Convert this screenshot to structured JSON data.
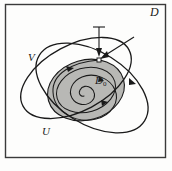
{
  "figure": {
    "type": "mathematical-diagram",
    "background_color": "#fdfdfc",
    "stroke_color": "#1a1a1a",
    "shade_color": "#b8b8b5",
    "frame": {
      "name": "outer-region-frame",
      "x": 5,
      "y": 4,
      "width": 161,
      "height": 154,
      "stroke": "#333333"
    },
    "labels": {
      "outer_region": "D",
      "ellipse_v": "V",
      "ellipse_u": "U",
      "inner_region_base": "D",
      "inner_region_sub": "0"
    },
    "marked_point": {
      "name": "convergence-point",
      "x": 99,
      "y": 60
    },
    "arrows": [
      {
        "name": "vertical-arrow",
        "from_x": 99,
        "from_y": 27,
        "to_x": 99,
        "to_y": 57
      },
      {
        "name": "diagonal-arrow",
        "from_x": 131,
        "from_y": 38,
        "to_x": 103,
        "to_y": 57
      }
    ],
    "spiral": {
      "name": "inward-spiral-trajectory",
      "turns": 2.6,
      "center_x": 82,
      "center_y": 90,
      "arrowheads": [
        {
          "x": 72,
          "y": 68
        },
        {
          "x": 101,
          "y": 79
        },
        {
          "x": 104,
          "y": 103
        }
      ]
    },
    "ellipses": [
      {
        "name": "ellipse-v",
        "cx": 76,
        "cy": 78,
        "rx": 60,
        "ry": 33,
        "rotation": -28
      },
      {
        "name": "ellipse-u",
        "cx": 92,
        "cy": 88,
        "rx": 62,
        "ry": 36,
        "rotation": 32
      },
      {
        "name": "ellipse-d0-shaded",
        "cx": 86,
        "cy": 90,
        "rx": 39,
        "ry": 30,
        "rotation": -16
      },
      {
        "name": "ellipse-d0-inner",
        "cx": 86,
        "cy": 90,
        "rx": 30,
        "ry": 22,
        "rotation": -16
      }
    ],
    "caption": {
      "left_fragment": "",
      "right_fragment": ""
    }
  }
}
